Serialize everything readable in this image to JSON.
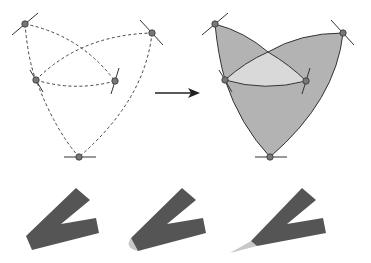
{
  "colors": {
    "background": "#ffffff",
    "stroke": "#333333",
    "point_fill": "#777777",
    "region_dark": "#b3b3b3",
    "region_light": "#d9d9d9",
    "stroke_body": "#555555",
    "join_cap": "#c8c8c8"
  },
  "diagram": {
    "left_figure": {
      "style": "dashed-curves",
      "points": [
        [
          25,
          24
        ],
        [
          152,
          33
        ],
        [
          36,
          80
        ],
        [
          115,
          81
        ],
        [
          79,
          157
        ]
      ]
    },
    "arrow": {
      "from": [
        155,
        93
      ],
      "to": [
        200,
        93
      ],
      "icon": "arrow-right-icon"
    },
    "right_figure": {
      "style": "filled-regions",
      "points": [
        [
          215,
          24
        ],
        [
          343,
          33
        ],
        [
          225,
          80
        ],
        [
          306,
          81
        ],
        [
          270,
          157
        ]
      ]
    },
    "joins": [
      {
        "name": "bevel-join"
      },
      {
        "name": "round-join"
      },
      {
        "name": "miter-join"
      }
    ]
  }
}
